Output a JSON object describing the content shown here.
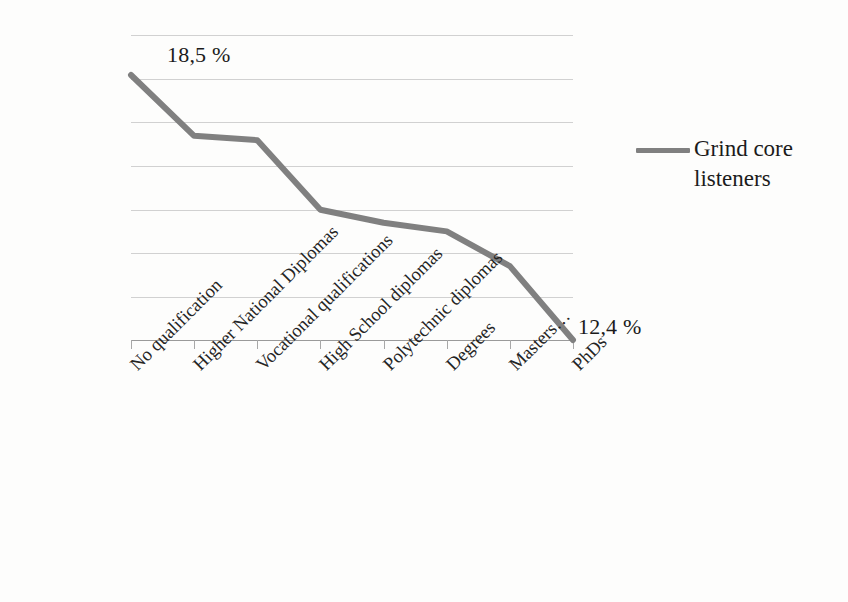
{
  "chart_data": {
    "type": "line",
    "title": "",
    "xlabel": "",
    "ylabel": "",
    "categories": [
      "No qualification",
      "Higher National Diplomas",
      "Vocational qualifications",
      "High School diplomas",
      "Polytechnic diplomas",
      "Degrees",
      "Masters…",
      "PhDs"
    ],
    "series": [
      {
        "name": "Grind core listeners",
        "color": "#808080",
        "values": [
          18.5,
          17.1,
          17.0,
          15.4,
          15.1,
          14.9,
          14.1,
          12.4
        ],
        "units": "%"
      }
    ],
    "point_labels": {
      "first": "18,5 %",
      "last": "12,4 %"
    },
    "ylim": [
      12.4,
      19.4
    ],
    "gridlines": 8,
    "grid": true,
    "grid_color": "#c9c9c9",
    "axis_color": "#9a9a9a",
    "legend_position": "right",
    "tick_labels_rotation": -45
  },
  "legend": {
    "entries": [
      {
        "label": "Grind core listeners",
        "color": "#808080"
      }
    ]
  },
  "labels": {
    "first_value": "18,5 %",
    "last_value": "12,4 %"
  }
}
